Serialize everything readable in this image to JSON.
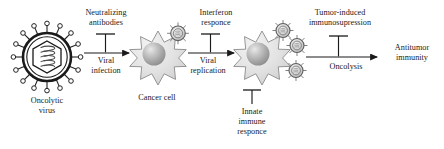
{
  "figure": {
    "background_color": "#ffffff",
    "text_color": "#1a1a1a"
  },
  "labels": {
    "neutralizing_antibodies": "Neutralizing\nantibodies",
    "viral_infection": "Viral\ninfection",
    "oncolytic_virus": "Oncolytic\nvirus",
    "cancer_cell": "Cancer cell",
    "interferon_responce": "Interferon\nresponce",
    "viral_replication": "Viral\nreplication",
    "innate_immune_responce": "Innate\nimmune\nresponce",
    "tumor_induced_immunosupression": "Tumor-induced\nimmunosupression",
    "oncolysis": "Oncolysis",
    "antitumor_immunity": "Antitumor\nimmunity"
  },
  "nodes": [
    {
      "id": "oncolytic-virus",
      "name": "oncolytic-virus-icon",
      "label": "Oncolytic\nvirus",
      "shape": "spiked-enveloped-virion-with-hexagonal-capsid",
      "cx": 47,
      "cy": 57,
      "radius": 30,
      "stroke_color": "#222222",
      "fill_color": "#ffffff",
      "spike_count": 16
    },
    {
      "id": "cancer-cell-1",
      "name": "cancer-cell-icon",
      "label": "Cancer cell",
      "shape": "spiky-star-cell-with-nucleus",
      "cx": 158,
      "cy": 58,
      "radius": 26,
      "points": 14,
      "fill_color": "#e4e4e4",
      "stroke_color": "#7d7d7d",
      "nucleus_color": "#b5b5b5",
      "attached_virions": 1
    },
    {
      "id": "cancer-cell-2",
      "name": "infected-cancer-cell-icon",
      "label": "",
      "shape": "spiky-star-cell-with-nucleus",
      "cx": 262,
      "cy": 58,
      "radius": 26,
      "points": 14,
      "fill_color": "#e4e4e4",
      "stroke_color": "#7d7d7d",
      "nucleus_color": "#b5b5b5",
      "attached_virions": 3
    },
    {
      "id": "released-virion",
      "name": "released-virion-icon",
      "label": "",
      "shape": "small-spiked-virion",
      "cx": 305,
      "cy": 71,
      "radius": 9,
      "fill_color": "#d8d8d8",
      "stroke_color": "#6d6d6d"
    }
  ],
  "arrows": [
    {
      "id": "arrow-viral-infection",
      "name": "arrow-viral-infection",
      "from": "oncolytic-virus",
      "to": "cancer-cell-1",
      "label": "Viral\ninfection",
      "x1": 79,
      "x2": 131,
      "y": 53,
      "inhibitor": {
        "name": "inhibition-bar-neutralizing-antibodies",
        "label": "Neutralizing\nantibodies",
        "x": 105,
        "top_y": 33
      }
    },
    {
      "id": "arrow-viral-replication",
      "name": "arrow-viral-replication",
      "from": "cancer-cell-1",
      "to": "cancer-cell-2",
      "label": "Viral\nreplication",
      "x1": 184,
      "x2": 236,
      "y": 53,
      "inhibitor": {
        "name": "inhibition-bar-interferon-responce",
        "label": "Interferon\nresponce",
        "x": 210,
        "top_y": 33
      }
    },
    {
      "id": "arrow-oncolysis",
      "name": "arrow-oncolysis",
      "from": "cancer-cell-2",
      "to": "antitumor-immunity",
      "label": "Oncolysis",
      "x1": 300,
      "x2": 378,
      "y": 57,
      "inhibitor": {
        "name": "inhibition-bar-tumor-induced-immunosupression",
        "label": "Tumor-induced\nimmunosupression",
        "x": 338,
        "top_y": 33
      }
    }
  ],
  "standalone_inhibitors": [
    {
      "id": "innate-immune-inhibitor",
      "name": "inhibition-bar-innate-immune-responce",
      "label": "Innate\nimmune\nresponce",
      "x": 252,
      "bar_y": 90,
      "bottom_y": 105
    }
  ],
  "endpoints": [
    {
      "id": "antitumor-immunity",
      "name": "antitumor-immunity-endpoint",
      "label": "Antitumor\nimmunity"
    }
  ]
}
